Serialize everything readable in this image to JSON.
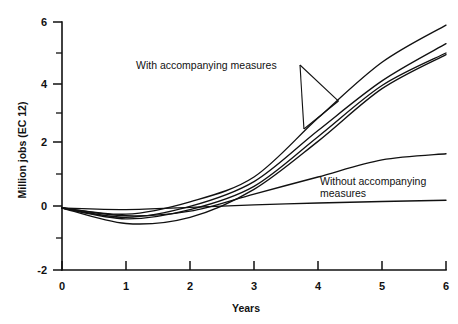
{
  "chart_data": {
    "type": "line",
    "title": "",
    "xlabel": "Years",
    "ylabel": "Million jobs (EC 12)",
    "xlim": [
      0,
      6
    ],
    "ylim": [
      -2,
      6
    ],
    "grid": false,
    "legend_position": "inline-annotations",
    "x_ticks": [
      "0",
      "1",
      "2",
      "3",
      "4",
      "5",
      "6"
    ],
    "y_ticks": [
      "-2",
      "0",
      "2",
      "4",
      "6"
    ],
    "y_minor_ticks": [
      "-1",
      "1",
      "3",
      "5"
    ],
    "x": [
      0,
      1,
      2,
      3,
      4,
      5,
      6
    ],
    "series": [
      {
        "name": "With accompanying measures - upper",
        "group": "with",
        "values": [
          0,
          -0.2,
          0.2,
          1.0,
          2.9,
          4.7,
          5.9
        ]
      },
      {
        "name": "With accompanying measures - middle",
        "group": "with",
        "values": [
          0,
          -0.3,
          0.05,
          0.85,
          2.5,
          4.1,
          5.3
        ]
      },
      {
        "name": "With accompanying measures - lower",
        "group": "with",
        "values": [
          0,
          -0.35,
          -0.05,
          0.7,
          2.3,
          3.95,
          5.0
        ]
      },
      {
        "name": "With accompanying measures - lowest",
        "group": "with",
        "values": [
          0,
          -0.5,
          -0.3,
          0.6,
          2.15,
          3.85,
          4.95
        ]
      },
      {
        "name": "Without accompanying measures - rising",
        "group": "without",
        "values": [
          0,
          -0.25,
          -0.1,
          0.45,
          1.0,
          1.55,
          1.75
        ]
      },
      {
        "name": "Without accompanying measures - flat",
        "group": "without",
        "values": [
          0,
          -0.05,
          0.02,
          0.1,
          0.16,
          0.21,
          0.25
        ]
      }
    ],
    "annotations": [
      {
        "id": "with-measures",
        "text": "With accompanying measures",
        "text_x": 1.2,
        "text_y": 4.55,
        "points_to": [
          {
            "x": 4.32,
            "y": 3.45
          },
          {
            "x": 3.78,
            "y": 2.55
          }
        ]
      },
      {
        "id": "without-measures",
        "line1": "Without accompanying",
        "line2": "measures",
        "text_x": 4.1,
        "text_y": 1.05
      }
    ]
  },
  "axis": {
    "x_title": "Years",
    "y_title": "Million jobs (EC 12)"
  },
  "colors": {
    "line": "#111111",
    "background": "#ffffff",
    "text": "#111111"
  }
}
